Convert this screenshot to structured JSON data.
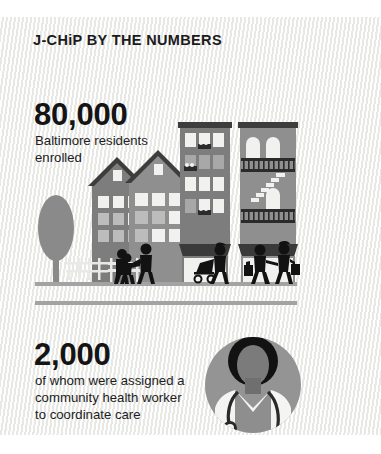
{
  "poster": {
    "title": "J-CHiP BY THE NUMBERS",
    "background_color": "#f2f2f0",
    "text_color": "#1b1b1b",
    "divider_color": "#a3a3a3"
  },
  "stats": [
    {
      "number": "80,000",
      "line1": "Baltimore residents",
      "line2": "enrolled",
      "line3": "",
      "description": "Baltimore residents enrolled"
    },
    {
      "number": "2,000",
      "line1": "of whom were assigned a",
      "line2": "community health worker",
      "line3": "to coordinate care",
      "description": "of whom were assigned a community health worker to coordinate care"
    }
  ],
  "illustration": {
    "name": "city-street-scene",
    "ground_line_color": "#a3a3a3",
    "elements": [
      "tree-icon",
      "house-icon",
      "house-icon",
      "apartment-building-icon",
      "rowhouse-fire-escape-icon",
      "fence-icon",
      "bench-icon",
      "pedestrian-figure",
      "pedestrian-figure",
      "pedestrian-child-figure",
      "stroller-figure",
      "pedestrian-pair-figure"
    ],
    "palette": {
      "building_dark": "#7d7d7d",
      "building_mid": "#8f8f8f",
      "building_light": "#a8a8a8",
      "roof_dark": "#3d3d3d",
      "window_light": "#f1f1ef",
      "window_shade": "#bcbcbc",
      "figure": "#121212",
      "tree": "#8a8a8a"
    }
  },
  "avatar": {
    "name": "doctor-avatar",
    "circle_color": "#949494",
    "coat_color": "#f4f4f2",
    "hair_color": "#121212",
    "skin_color": "#7b7b7b",
    "stethoscope_color": "#2a2a2a",
    "description": "community health worker with stethoscope"
  }
}
